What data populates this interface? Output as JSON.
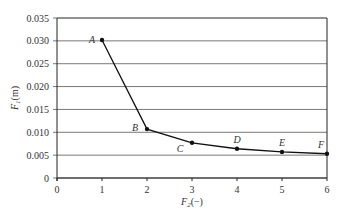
{
  "chart_data": {
    "type": "line",
    "title": "",
    "xlabel": "F2(−)",
    "ylabel": "F1(m)",
    "x": [
      1,
      2,
      3,
      4,
      5,
      6
    ],
    "series": [
      {
        "name": "F1 vs F2",
        "values": [
          0.0302,
          0.0107,
          0.0077,
          0.0064,
          0.0057,
          0.0053
        ],
        "point_labels": [
          "A",
          "B",
          "C",
          "D",
          "E",
          "F"
        ]
      }
    ],
    "xlim": [
      0,
      6
    ],
    "ylim": [
      0,
      0.035
    ],
    "xticks": [
      "0",
      "1",
      "2",
      "3",
      "4",
      "5",
      "6"
    ],
    "yticks": [
      "0",
      "0.005",
      "0.010",
      "0.015",
      "0.020",
      "0.025",
      "0.030",
      "0.035"
    ],
    "grid": "horizontal",
    "legend": "none"
  },
  "axes": {
    "xlabel_main": "F",
    "xlabel_sub": "2",
    "xlabel_suffix": "(−)",
    "ylabel_main": "F",
    "ylabel_sub": "1",
    "ylabel_suffix": "(m)"
  },
  "colors": {
    "line": "#111111",
    "grid": "#555555",
    "text": "#333333"
  }
}
